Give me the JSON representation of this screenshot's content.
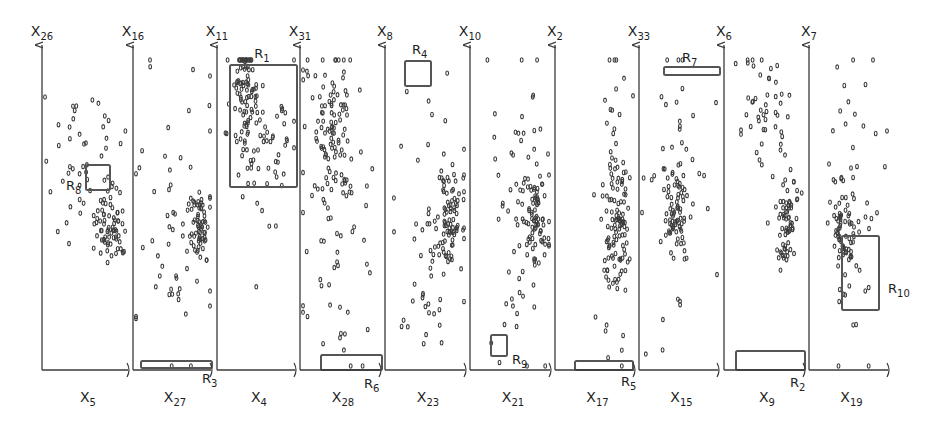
{
  "chart_data": {
    "type": "scatter",
    "title": "",
    "layout": {
      "grid": false,
      "legend": "none",
      "y_axis_top": 42,
      "x_axis_y": 370
    },
    "vertical_axes": [
      {
        "name": "X26",
        "base": "X",
        "sub": "26",
        "x": 42
      },
      {
        "name": "X16",
        "base": "X",
        "sub": "16",
        "x": 133
      },
      {
        "name": "X11",
        "base": "X",
        "sub": "11",
        "x": 217
      },
      {
        "name": "X31",
        "base": "X",
        "sub": "31",
        "x": 300
      },
      {
        "name": "X8",
        "base": "X",
        "sub": "8",
        "x": 385
      },
      {
        "name": "X10",
        "base": "X",
        "sub": "10",
        "x": 470
      },
      {
        "name": "X2",
        "base": "X",
        "sub": "2",
        "x": 555
      },
      {
        "name": "X33",
        "base": "X",
        "sub": "33",
        "x": 639
      },
      {
        "name": "X6",
        "base": "X",
        "sub": "6",
        "x": 724
      },
      {
        "name": "X7",
        "base": "X",
        "sub": "7",
        "x": 809
      }
    ],
    "horizontal_axes": [
      {
        "name": "X5",
        "base": "X",
        "sub": "5",
        "x0": 42,
        "x1": 130
      },
      {
        "name": "X27",
        "base": "X",
        "sub": "27",
        "x0": 133,
        "x1": 213
      },
      {
        "name": "X4",
        "base": "X",
        "sub": "4",
        "x0": 217,
        "x1": 297
      },
      {
        "name": "X28",
        "base": "X",
        "sub": "28",
        "x0": 300,
        "x1": 382
      },
      {
        "name": "X23",
        "base": "X",
        "sub": "23",
        "x0": 385,
        "x1": 467
      },
      {
        "name": "X21",
        "base": "X",
        "sub": "21",
        "x0": 470,
        "x1": 552
      },
      {
        "name": "X17",
        "base": "X",
        "sub": "17",
        "x0": 555,
        "x1": 636
      },
      {
        "name": "X15",
        "base": "X",
        "sub": "15",
        "x0": 639,
        "x1": 720
      },
      {
        "name": "X9",
        "base": "X",
        "sub": "9",
        "x0": 724,
        "x1": 806
      },
      {
        "name": "X19",
        "base": "X",
        "sub": "19",
        "x0": 809,
        "x1": 890
      }
    ],
    "panels": [
      {
        "x_axis": "X5",
        "y_axis": "X26",
        "clusters": [
          {
            "cx": 0.8,
            "cy": 0.54,
            "sx": 0.1,
            "sy": 0.06,
            "n": 70
          },
          {
            "cx": 0.45,
            "cy": 0.3,
            "sx": 0.25,
            "sy": 0.12,
            "n": 45
          }
        ]
      },
      {
        "x_axis": "X27",
        "y_axis": "X16",
        "clusters": [
          {
            "cx": 0.85,
            "cy": 0.55,
            "sx": 0.07,
            "sy": 0.07,
            "n": 60
          },
          {
            "cx": 0.5,
            "cy": 0.55,
            "sx": 0.3,
            "sy": 0.25,
            "n": 55
          }
        ]
      },
      {
        "x_axis": "X4",
        "y_axis": "X11",
        "clusters": [
          {
            "cx": 0.35,
            "cy": 0.12,
            "sx": 0.08,
            "sy": 0.1,
            "n": 80
          },
          {
            "cx": 0.6,
            "cy": 0.25,
            "sx": 0.25,
            "sy": 0.15,
            "n": 60
          }
        ]
      },
      {
        "x_axis": "X28",
        "y_axis": "X31",
        "clusters": [
          {
            "cx": 0.4,
            "cy": 0.2,
            "sx": 0.15,
            "sy": 0.15,
            "n": 90
          },
          {
            "cx": 0.45,
            "cy": 0.55,
            "sx": 0.3,
            "sy": 0.25,
            "n": 60
          }
        ]
      },
      {
        "x_axis": "X23",
        "y_axis": "X8",
        "clusters": [
          {
            "cx": 0.8,
            "cy": 0.52,
            "sx": 0.08,
            "sy": 0.08,
            "n": 70
          },
          {
            "cx": 0.6,
            "cy": 0.55,
            "sx": 0.25,
            "sy": 0.28,
            "n": 60
          }
        ]
      },
      {
        "x_axis": "X21",
        "y_axis": "X10",
        "clusters": [
          {
            "cx": 0.82,
            "cy": 0.52,
            "sx": 0.08,
            "sy": 0.08,
            "n": 70
          },
          {
            "cx": 0.55,
            "cy": 0.5,
            "sx": 0.25,
            "sy": 0.28,
            "n": 60
          }
        ]
      },
      {
        "x_axis": "X17",
        "y_axis": "X2",
        "clusters": [
          {
            "cx": 0.8,
            "cy": 0.55,
            "sx": 0.07,
            "sy": 0.1,
            "n": 70
          },
          {
            "cx": 0.75,
            "cy": 0.4,
            "sx": 0.12,
            "sy": 0.3,
            "n": 60
          }
        ]
      },
      {
        "x_axis": "X15",
        "y_axis": "X33",
        "clusters": [
          {
            "cx": 0.45,
            "cy": 0.5,
            "sx": 0.07,
            "sy": 0.06,
            "n": 60
          },
          {
            "cx": 0.45,
            "cy": 0.4,
            "sx": 0.25,
            "sy": 0.25,
            "n": 50
          }
        ]
      },
      {
        "x_axis": "X9",
        "y_axis": "X6",
        "clusters": [
          {
            "cx": 0.8,
            "cy": 0.52,
            "sx": 0.07,
            "sy": 0.08,
            "n": 70
          },
          {
            "cx": 0.5,
            "cy": 0.15,
            "sx": 0.18,
            "sy": 0.08,
            "n": 45
          }
        ]
      },
      {
        "x_axis": "X19",
        "y_axis": "X7",
        "clusters": [
          {
            "cx": 0.4,
            "cy": 0.55,
            "sx": 0.08,
            "sy": 0.07,
            "n": 60
          },
          {
            "cx": 0.55,
            "cy": 0.45,
            "sx": 0.18,
            "sy": 0.3,
            "n": 50
          }
        ]
      }
    ],
    "regions": [
      {
        "label": "R1",
        "base": "R",
        "sub": "1",
        "x0": 230,
        "y0": 65,
        "x1": 297,
        "y1": 187,
        "lx": 262,
        "ly": 58,
        "anchor": "middle"
      },
      {
        "label": "R2",
        "base": "R",
        "sub": "2",
        "x0": 736,
        "y0": 351,
        "x1": 805,
        "y1": 370,
        "lx": 790,
        "ly": 387,
        "anchor": "start"
      },
      {
        "label": "R3",
        "base": "R",
        "sub": "3",
        "x0": 141,
        "y0": 361,
        "x1": 212,
        "y1": 368,
        "lx": 202,
        "ly": 383,
        "anchor": "start"
      },
      {
        "label": "R4",
        "base": "R",
        "sub": "4",
        "x0": 405,
        "y0": 61,
        "x1": 431,
        "y1": 86,
        "lx": 412,
        "ly": 54,
        "anchor": "start"
      },
      {
        "label": "R5",
        "base": "R",
        "sub": "5",
        "x0": 575,
        "y0": 361,
        "x1": 633,
        "y1": 370,
        "lx": 621,
        "ly": 386,
        "anchor": "start"
      },
      {
        "label": "R6",
        "base": "R",
        "sub": "6",
        "x0": 321,
        "y0": 355,
        "x1": 382,
        "y1": 370,
        "lx": 364,
        "ly": 388,
        "anchor": "start"
      },
      {
        "label": "R7",
        "base": "R",
        "sub": "7",
        "x0": 664,
        "y0": 67,
        "x1": 720,
        "y1": 75,
        "lx": 682,
        "ly": 62,
        "anchor": "start"
      },
      {
        "label": "R8",
        "base": "R",
        "sub": "8",
        "x0": 86,
        "y0": 165,
        "x1": 110,
        "y1": 190,
        "lx": 66,
        "ly": 190,
        "anchor": "start"
      },
      {
        "label": "R9",
        "base": "R",
        "sub": "9",
        "x0": 491,
        "y0": 335,
        "x1": 507,
        "y1": 356,
        "lx": 512,
        "ly": 364,
        "anchor": "start"
      },
      {
        "label": "R10",
        "base": "R",
        "sub": "10",
        "x0": 842,
        "y0": 236,
        "x1": 879,
        "y1": 310,
        "lx": 888,
        "ly": 293,
        "anchor": "start"
      }
    ],
    "colors": {
      "axis": "#3a3a3a",
      "point": "#3c3c3c",
      "region": "#555555",
      "background": "#ffffff"
    }
  }
}
